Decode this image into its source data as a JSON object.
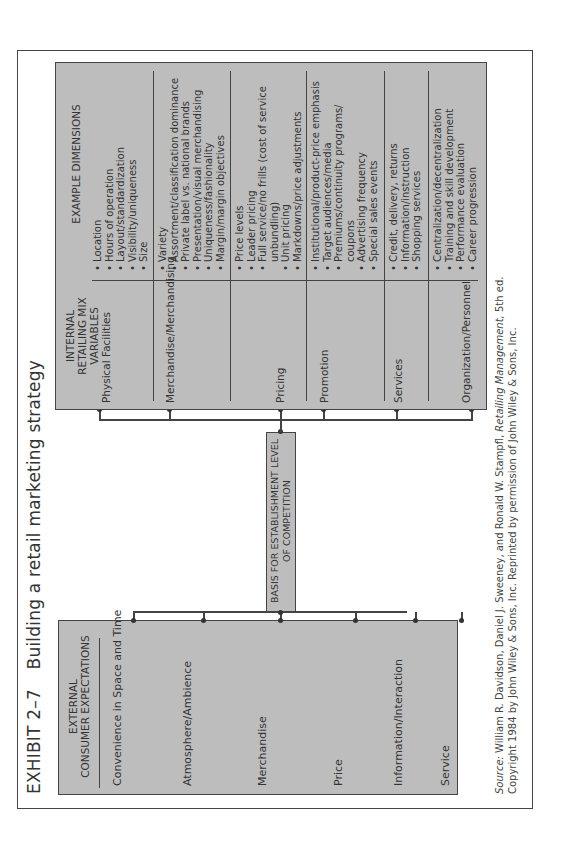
{
  "exhibit": {
    "number": "EXHIBIT 2–7",
    "title": "Building a retail marketing strategy"
  },
  "external": {
    "header_line1": "EXTERNAL",
    "header_line2": "CONSUMER EXPECTATIONS",
    "items": [
      "Convenience in Space and Time",
      "Atmosphere/Ambience",
      "Merchandise",
      "Price",
      "Information/Interaction",
      "Service"
    ]
  },
  "center": {
    "line1": "BASIS FOR ESTABLISHMENT LEVEL",
    "line2": "OF COMPETITION"
  },
  "internal": {
    "header_left_line1": "INTERNAL",
    "header_left_line2": "RETAILING MIX VARIABLES",
    "header_right": "EXAMPLE DIMENSIONS",
    "rows": [
      {
        "variable": "Physical Facilities",
        "dimensions": [
          "Location",
          "Hours of operation",
          "Layout/standardization",
          "Visibility/uniqueness",
          "Size"
        ]
      },
      {
        "variable": "Merchandise/Merchandising",
        "dimensions": [
          "Variety",
          "Assortment/classification dominance",
          "Private label vs. national brands",
          "Presentation/visual merchandising",
          "Uniqueness/fashionality",
          "Margin/margin objectives"
        ]
      },
      {
        "variable": "Pricing",
        "dimensions": [
          "Price levels",
          "Leader pricing",
          "Full service/no frills (cost of service unbundling)",
          "Unit pricing",
          "Markdowns/price adjustments"
        ]
      },
      {
        "variable": "Promotion",
        "dimensions": [
          "Institutional/product-price emphasis",
          "Target audiences/media",
          "Premiums/continuity programs/ coupons",
          "Advertising frequency",
          "Special sales events"
        ]
      },
      {
        "variable": "Services",
        "dimensions": [
          "Credit, delivery, returns",
          "Information/instruction",
          "Shopping services"
        ]
      },
      {
        "variable": "Organization/Personnel",
        "dimensions": [
          "Centralization/decentralization",
          "Training and skill development",
          "Performance evaluation",
          "Career progression"
        ]
      }
    ]
  },
  "source": {
    "label": "Source:",
    "text_a": " William R. Davidson, Daniel J. Sweeney, and Ronald W. Stampfl, ",
    "book": "Retailing Management,",
    "text_b": " 5th ed.",
    "line2": "Copyright 1984 by John Wiley & Sons, Inc. Reprinted by permission of John Wiley & Sons, Inc."
  },
  "colors": {
    "box_fill": "#bdbdbd",
    "line": "#444444",
    "background": "#ffffff"
  }
}
